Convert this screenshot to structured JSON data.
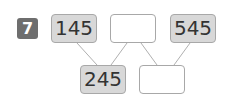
{
  "problem": {
    "number": "7",
    "top_row": [
      {
        "value": "145",
        "filled": true
      },
      {
        "value": "",
        "filled": false
      },
      {
        "value": "545",
        "filled": true
      }
    ],
    "bottom_row": [
      {
        "value": "245",
        "filled": true
      },
      {
        "value": "",
        "filled": false
      }
    ]
  },
  "colors": {
    "badge": "#6e6e6e",
    "filled_box": "#d8d8d8",
    "border": "#a8a8a8",
    "line": "#b0b0b0"
  }
}
